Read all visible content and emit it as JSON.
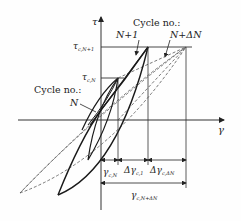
{
  "diagram": {
    "type": "stress-strain hysteresis loops (cyclic shear)",
    "axes": {
      "y_label": "τ",
      "x_label": "γ"
    },
    "stress_levels": [
      {
        "id": "tau_c_N1",
        "label": "τ",
        "sub": "c,N+1"
      },
      {
        "id": "tau_c_N",
        "label": "τ",
        "sub": "c,N"
      }
    ],
    "cycle_labels": {
      "top_heading": "Cycle no.:",
      "top_left": "N+1",
      "top_right": "N+ΔN",
      "left_heading": "Cycle no.:",
      "left": "N"
    },
    "dimensions": {
      "row1": [
        {
          "label": "γ",
          "sub": "c,N"
        },
        {
          "label": "Δγ",
          "sub": "c,1"
        },
        {
          "label": "Δγ",
          "sub": "c,ΔN"
        }
      ],
      "row2": {
        "label": "γ",
        "sub": "c,N+ΔN"
      }
    },
    "colors": {
      "line": "#1a1a1a",
      "dashed": "#555555",
      "background": "#fefefe"
    }
  }
}
